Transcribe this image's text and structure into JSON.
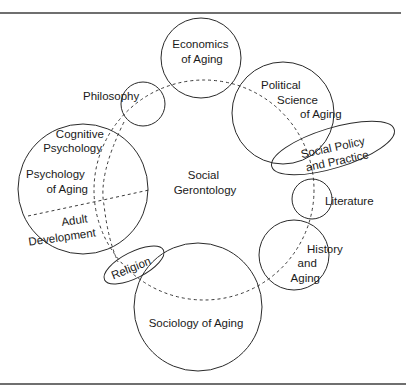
{
  "figure": {
    "center_label": [
      "Social",
      "Gerontology"
    ],
    "disciplines": [
      {
        "id": "economics",
        "label": [
          "Economics",
          "of Aging"
        ]
      },
      {
        "id": "philosophy",
        "label": [
          "Philosophy"
        ]
      },
      {
        "id": "political-science",
        "label": [
          "Political",
          "Science",
          "of Aging"
        ]
      },
      {
        "id": "social-policy",
        "label": [
          "Social Policy",
          "and Practice"
        ]
      },
      {
        "id": "literature",
        "label": [
          "Literature"
        ]
      },
      {
        "id": "history",
        "label": [
          "History",
          "and",
          "Aging"
        ]
      },
      {
        "id": "sociology",
        "label": [
          "Sociology of Aging"
        ]
      },
      {
        "id": "religion",
        "label": [
          "Religion"
        ]
      },
      {
        "id": "psychology",
        "label": [
          "Psychology",
          "of Aging"
        ]
      },
      {
        "id": "cognitive-psychology",
        "label": [
          "Cognitive",
          "Psychology"
        ]
      },
      {
        "id": "adult-development",
        "label": [
          "Adult",
          "Development"
        ]
      }
    ]
  }
}
